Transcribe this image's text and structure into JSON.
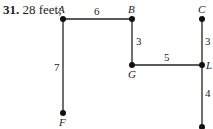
{
  "problem": {
    "number": "31.",
    "answer": "28 feet;"
  },
  "graph": {
    "vertices": [
      {
        "id": "A",
        "label": "A",
        "x": 63,
        "y": 19
      },
      {
        "id": "B",
        "label": "B",
        "x": 132,
        "y": 19
      },
      {
        "id": "C",
        "label": "C",
        "x": 202,
        "y": 19
      },
      {
        "id": "G",
        "label": "G",
        "x": 132,
        "y": 65
      },
      {
        "id": "L",
        "label": "L",
        "x": 202,
        "y": 65
      },
      {
        "id": "F",
        "label": "F",
        "x": 63,
        "y": 113
      },
      {
        "id": "E",
        "label": "",
        "x": 202,
        "y": 127
      }
    ],
    "edges": [
      {
        "from": "A",
        "to": "B",
        "weight": "6"
      },
      {
        "from": "A",
        "to": "F",
        "weight": "7"
      },
      {
        "from": "B",
        "to": "G",
        "weight": "3"
      },
      {
        "from": "G",
        "to": "L",
        "weight": "5"
      },
      {
        "from": "C",
        "to": "L",
        "weight": "3"
      },
      {
        "from": "L",
        "to": "E",
        "weight": "4"
      }
    ]
  }
}
